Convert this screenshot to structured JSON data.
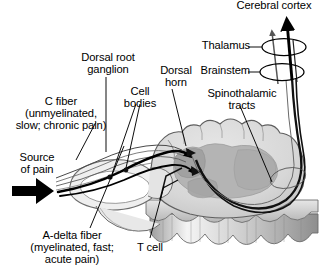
{
  "diagram": {
    "labels": {
      "cerebral_cortex": "Cerebral cortex",
      "thalamus": "Thalamus",
      "brainstem": "Brainstem",
      "dorsal_root_ganglion": "Dorsal root\nganglion",
      "cell_bodies": "Cell\nbodies",
      "dorsal_horn": "Dorsal\nhorn",
      "spinothalamic_tracts": "Spinothalamic\ntracts",
      "c_fiber": "C fiber\n(unmyelinated,\nslow; chronic pain)",
      "source_of_pain": "Source\nof pain",
      "a_delta_fiber": "A-delta fiber\n(myelinated, fast;\nacute pain)",
      "t_cell": "T cell"
    },
    "icons": {
      "pain_arrow": "thick-right-arrow-icon",
      "ascending_arrow_thick": "thick-up-arrow-icon",
      "ascending_arrow_thin": "thin-up-arrow-icon",
      "synapse_marker": "arrowhead-icon",
      "cell_body_dot": "dot-icon"
    },
    "colors": {
      "ink": "#000000",
      "white_matter": "#d9d9d9",
      "grey_matter": "#b2b2b2",
      "grey_matter_dark": "#9a9a9a",
      "outline": "#4d4d4d",
      "vertebra_light": "#f2f2f2",
      "vertebra_mid": "#bdbdbd",
      "background": "#ffffff"
    },
    "structures": [
      "cerebral cortex",
      "thalamus",
      "brainstem",
      "spinothalamic tracts",
      "dorsal horn",
      "dorsal root ganglion",
      "cell bodies",
      "T cell",
      "C fiber",
      "A-delta fiber",
      "spinal cord white matter",
      "spinal cord grey matter",
      "vertebral body"
    ]
  }
}
